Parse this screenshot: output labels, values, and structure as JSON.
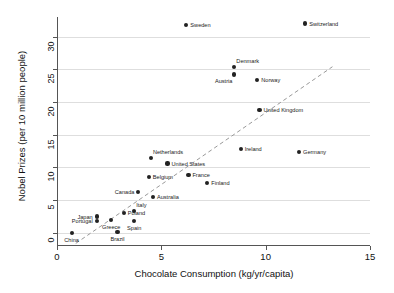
{
  "chart_data": {
    "type": "scatter",
    "title": "",
    "xlabel": "Chocolate Consumption (kg/yr/capita)",
    "ylabel": "Nobel Prizes (per 10 million people)",
    "xlim": [
      0,
      15
    ],
    "ylim": [
      -2,
      33
    ],
    "xticks": [
      0,
      5,
      10,
      15
    ],
    "yticks": [
      0,
      5,
      10,
      15,
      20,
      25,
      30
    ],
    "xtick_labels": [
      "0",
      "5",
      "10",
      "15"
    ],
    "ytick_labels": [
      "0",
      "5",
      "10",
      "15",
      "20",
      "25",
      "30"
    ],
    "grid": "horizontal",
    "legend": "none",
    "point_color": "#222222",
    "grid_color": "#dedede",
    "axis_color": "#555555",
    "trendline": {
      "style": "dashed",
      "color": "#999999",
      "x0": 0.9,
      "y0": -1.6,
      "x1": 13.2,
      "y1": 25.4
    },
    "points": [
      {
        "label": "Sweden",
        "x": 6.2,
        "y": 31.8,
        "label_pos": "right"
      },
      {
        "label": "Switzerland",
        "x": 11.9,
        "y": 32.0,
        "label_pos": "right"
      },
      {
        "label": "Denmark",
        "x": 8.5,
        "y": 25.4,
        "label_pos": "ar"
      },
      {
        "label": "Austria",
        "x": 8.5,
        "y": 24.2,
        "label_pos": "bl"
      },
      {
        "label": "Norway",
        "x": 9.6,
        "y": 23.4,
        "label_pos": "right"
      },
      {
        "label": "United Kingdom",
        "x": 9.7,
        "y": 18.8,
        "label_pos": "right"
      },
      {
        "label": "Ireland",
        "x": 8.8,
        "y": 12.8,
        "label_pos": "right"
      },
      {
        "label": "Germany",
        "x": 11.6,
        "y": 12.4,
        "label_pos": "right"
      },
      {
        "label": "Netherlands",
        "x": 4.5,
        "y": 11.4,
        "label_pos": "ar"
      },
      {
        "label": "United States",
        "x": 5.3,
        "y": 10.6,
        "label_pos": "right"
      },
      {
        "label": "France",
        "x": 6.3,
        "y": 8.9,
        "label_pos": "right"
      },
      {
        "label": "Belgium",
        "x": 4.4,
        "y": 8.5,
        "label_pos": "right"
      },
      {
        "label": "Finland",
        "x": 7.2,
        "y": 7.6,
        "label_pos": "right"
      },
      {
        "label": "Canada",
        "x": 3.9,
        "y": 6.2,
        "label_pos": "left"
      },
      {
        "label": "Australia",
        "x": 4.6,
        "y": 5.5,
        "label_pos": "right"
      },
      {
        "label": "Italy",
        "x": 3.7,
        "y": 3.4,
        "label_pos": "ar"
      },
      {
        "label": "Poland",
        "x": 3.2,
        "y": 3.0,
        "label_pos": "right"
      },
      {
        "label": "Japan",
        "x": 1.9,
        "y": 2.5,
        "label_pos": "left"
      },
      {
        "label": "Greece",
        "x": 2.6,
        "y": 2.0,
        "label_pos": "below"
      },
      {
        "label": "Spain",
        "x": 3.7,
        "y": 1.8,
        "label_pos": "below"
      },
      {
        "label": "Portugal",
        "x": 1.9,
        "y": 1.8,
        "label_pos": "left"
      },
      {
        "label": "Brazil",
        "x": 2.9,
        "y": 0.1,
        "label_pos": "below"
      },
      {
        "label": "China",
        "x": 0.7,
        "y": 0.0,
        "label_pos": "below"
      }
    ]
  }
}
